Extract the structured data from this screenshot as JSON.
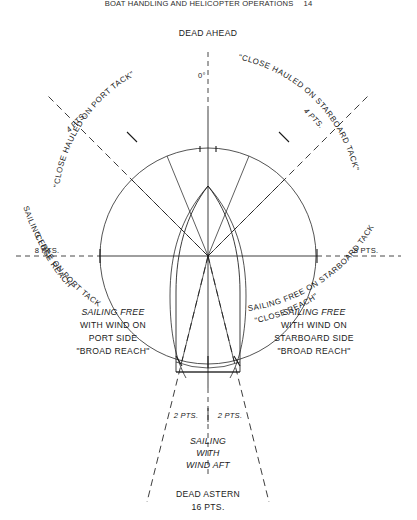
{
  "page": {
    "running_head": "BOAT HANDLING AND HELICOPTER OPERATIONS",
    "folio": "14"
  },
  "figure": {
    "center_label": "",
    "headings": {
      "dead_ahead": "DEAD AHEAD",
      "degrees_zero": "0°",
      "dead_astern": "DEAD ASTERN",
      "dead_astern_points": "16 PTS."
    },
    "bearing_marks": {
      "port_4pts": "4 PTS.",
      "starboard_4pts": "4 PTS.",
      "port_8pts": "8 PTS.",
      "starboard_8pts": "8 PTS.",
      "port_2pts": "2 PTS.",
      "starboard_2pts": "2 PTS."
    },
    "curved_labels": {
      "close_hauled_port": "\"CLOSE HAULED ON PORT TACK\"",
      "close_hauled_starboard": "\"CLOSE HAULED ON STARBOARD TACK\"",
      "sailing_free_port": "SAILING FREE ON PORT TACK",
      "close_reach_port": "\"CLOSE REACH\"",
      "sailing_free_starboard": "SAILING FREE ON STARBOARD TACK",
      "close_reach_starboard": "\"CLOSE REACH\""
    },
    "block_labels": {
      "port_broad": {
        "line1": "SAILING FREE",
        "line2": "WITH WIND ON",
        "line3": "PORT SIDE",
        "line4": "\"BROAD REACH\""
      },
      "starboard_broad": {
        "line1": "SAILING FREE",
        "line2": "WITH WIND ON",
        "line3": "STARBOARD SIDE",
        "line4": "\"BROAD REACH\""
      },
      "aft": {
        "line1": "SAILING",
        "line2": "WITH",
        "line3": "WIND AFT"
      }
    },
    "colors": {
      "ink": "#1a1a1a",
      "paper": "#ffffff"
    }
  }
}
